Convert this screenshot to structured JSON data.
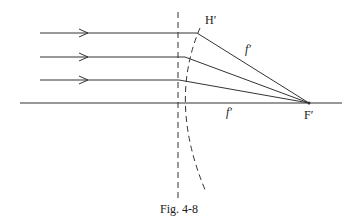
{
  "figure": {
    "caption": "Fig. 4-8",
    "labels": {
      "principal_point": "H′",
      "focal_point": "F′",
      "focal_length_upper": "f′",
      "focal_length_axis": "f′"
    },
    "geometry": {
      "axis_y": 103,
      "axis_x_start": 20,
      "axis_x_end": 342,
      "principal_plane_x": 178,
      "focal_point": [
        309,
        103
      ],
      "rays": [
        {
          "y": 33,
          "x_start": 40,
          "kink_x": 197
        },
        {
          "y": 57,
          "x_start": 40,
          "kink_x": 185
        },
        {
          "y": 80,
          "x_start": 40,
          "kink_x": 179
        }
      ]
    },
    "colors": {
      "line": "#333333",
      "background": "#ffffff"
    }
  }
}
